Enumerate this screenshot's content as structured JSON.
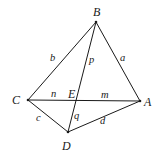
{
  "figure": {
    "type": "geometry-diagram",
    "background_color": "#ffffff",
    "stroke_color": "#1a1a1a",
    "stroke_width": 1
  },
  "vertices": [
    {
      "id": "B",
      "label": "B",
      "x": 96,
      "y": 22,
      "label_x": 93,
      "label_y": 6
    },
    {
      "id": "C",
      "label": "C",
      "x": 28,
      "y": 100,
      "label_x": 12,
      "label_y": 94
    },
    {
      "id": "A",
      "label": "A",
      "x": 140,
      "y": 101,
      "label_x": 144,
      "label_y": 96
    },
    {
      "id": "D",
      "label": "D",
      "x": 68,
      "y": 132,
      "label_x": 62,
      "label_y": 140
    },
    {
      "id": "E",
      "label": "E",
      "x": 76,
      "y": 101,
      "label_x": 68,
      "label_y": 88
    }
  ],
  "edges": [
    {
      "id": "BC",
      "from": "B",
      "to": "C",
      "label": "b",
      "label_x": 50,
      "label_y": 53
    },
    {
      "id": "BA",
      "from": "B",
      "to": "A",
      "label": "a",
      "label_x": 120,
      "label_y": 53
    },
    {
      "id": "BD",
      "from": "B",
      "to": "D",
      "label": "p",
      "label_x": 89,
      "label_y": 55
    },
    {
      "id": "ED",
      "from": "E",
      "to": "D",
      "label": "q",
      "label_x": 74,
      "label_y": 111
    },
    {
      "id": "CE",
      "from": "C",
      "to": "E",
      "label": "n",
      "label_x": 51,
      "label_y": 89
    },
    {
      "id": "EA",
      "from": "E",
      "to": "A",
      "label": "m",
      "label_x": 101,
      "label_y": 90
    },
    {
      "id": "CD",
      "from": "C",
      "to": "D",
      "label": "c",
      "label_x": 36,
      "label_y": 113
    },
    {
      "id": "DA",
      "from": "D",
      "to": "A",
      "label": "d",
      "label_x": 100,
      "label_y": 116
    }
  ],
  "lines": [
    {
      "id": "line-B-C",
      "x1": 96,
      "y1": 22,
      "x2": 28,
      "y2": 100
    },
    {
      "id": "line-B-A",
      "x1": 96,
      "y1": 22,
      "x2": 140,
      "y2": 101
    },
    {
      "id": "line-B-D",
      "x1": 96,
      "y1": 22,
      "x2": 68,
      "y2": 132
    },
    {
      "id": "line-C-A",
      "x1": 28,
      "y1": 100,
      "x2": 140,
      "y2": 101
    },
    {
      "id": "line-C-D",
      "x1": 28,
      "y1": 100,
      "x2": 68,
      "y2": 132
    },
    {
      "id": "line-D-A",
      "x1": 68,
      "y1": 132,
      "x2": 140,
      "y2": 101
    }
  ]
}
